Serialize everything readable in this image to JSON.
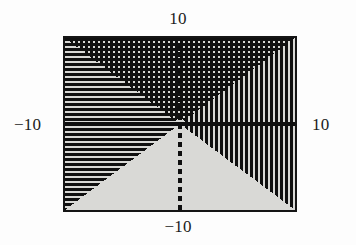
{
  "figure": {
    "background_color": "#fdfdfd",
    "frame": {
      "border_color": "#151515",
      "border_width_px": 2,
      "fill_color": "#d9d9d6",
      "left_px": 63,
      "top_px": 36,
      "width_px": 234,
      "height_px": 176
    }
  },
  "labels": {
    "top": "10",
    "bottom": "−10",
    "left": "−10",
    "right": "10"
  },
  "chart_data": {
    "type": "heatmap",
    "title": "",
    "subtitle": "",
    "xlabel": "",
    "ylabel": "",
    "xlim": [
      -10,
      10
    ],
    "ylim": [
      -10,
      10
    ],
    "xticks": [
      -10,
      10
    ],
    "ytick_labels": [
      "−10",
      "10"
    ],
    "xtick_labels": [
      "−10",
      "10"
    ],
    "yticks": [
      -10,
      10
    ],
    "grid": false,
    "legend": false,
    "legend_position": "none",
    "origin": {
      "x": 0,
      "y": 0,
      "px_x": 118,
      "px_y": 89
    },
    "axes": {
      "x_axis": {
        "label": "",
        "style": "solid",
        "color": "#0f0f0f",
        "thickness_px": 4,
        "y_value": 0,
        "from_x": -10,
        "to_x": 10
      },
      "y_axis": {
        "label": "",
        "style": "dashed",
        "color": "#0f0f0f",
        "thickness_px": 4,
        "x_value": 0,
        "from_y": -10,
        "to_y": 10,
        "dash_on_px": 5,
        "dash_off_px": 4
      }
    },
    "regions": [
      {
        "name": "left-wedge",
        "condition": "|x| > |y| and x < 0",
        "pattern": "horizontal-lines",
        "pattern_color": "#101010",
        "fill_color": "#d9d9d6",
        "line_spacing_px": 5,
        "line_width_px": 3,
        "vertices": [
          [
            0,
            0
          ],
          [
            -10,
            10
          ],
          [
            -10,
            -10
          ]
        ]
      },
      {
        "name": "top-wedge",
        "condition": "|y| > |x| and y > 0",
        "pattern": "crosshatch-grid",
        "pattern_color": "#101010",
        "fill_color": "#d9d9d6",
        "line_spacing_px": 5,
        "line_width_px": 3,
        "vertices": [
          [
            0,
            0
          ],
          [
            -10,
            10
          ],
          [
            10,
            10
          ]
        ]
      },
      {
        "name": "right-wedge",
        "condition": "|x| > |y| and x > 0",
        "pattern": "vertical-lines",
        "pattern_color": "#101010",
        "fill_color": "#d9d9d6",
        "line_spacing_px": 5,
        "line_width_px": 3,
        "vertices": [
          [
            0,
            0
          ],
          [
            10,
            10
          ],
          [
            10,
            -10
          ]
        ]
      },
      {
        "name": "bottom-wedge",
        "condition": "|y| > |x| and y < 0",
        "pattern": "solid",
        "pattern_color": "#d9d9d6",
        "fill_color": "#d9d9d6",
        "vertices": [
          [
            0,
            0
          ],
          [
            -10,
            -10
          ],
          [
            10,
            -10
          ]
        ]
      }
    ],
    "marker": {
      "name": "origin-bump",
      "shape": "triangle",
      "fill_color": "#d9d9d6",
      "x": 0,
      "y": 0.9,
      "width_units": 1.6,
      "height_units": 1.1
    }
  }
}
